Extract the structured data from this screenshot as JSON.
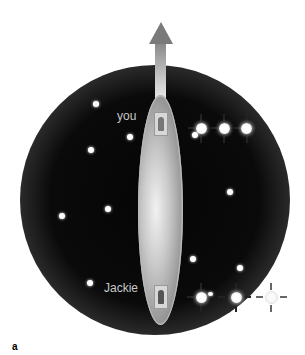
{
  "figure": {
    "panel_label": "a",
    "labels": {
      "top_person": "you",
      "bottom_person": "Jackie"
    },
    "colors": {
      "space": "#050505",
      "sphere_edge": "#ffffff",
      "capsule": "#c9c9c9",
      "arrow": "#7a7a7a",
      "stars": "#ffffff",
      "label_text": "#c8c8c8"
    },
    "icons": {
      "arrow": "up-arrow-icon",
      "person_top": "person-icon",
      "person_bottom": "person-icon"
    },
    "background_stars": [
      {
        "x": 96,
        "y": 104
      },
      {
        "x": 130,
        "y": 137
      },
      {
        "x": 91,
        "y": 150
      },
      {
        "x": 108,
        "y": 209
      },
      {
        "x": 62,
        "y": 216
      },
      {
        "x": 230,
        "y": 192
      },
      {
        "x": 193,
        "y": 259
      },
      {
        "x": 240,
        "y": 268
      },
      {
        "x": 90,
        "y": 283
      }
    ],
    "top_signal_row": {
      "y": 128,
      "stars_x": [
        201,
        224,
        246
      ],
      "small_dot": {
        "x": 195,
        "y": 135
      }
    },
    "bottom_signal_row": {
      "y": 297,
      "stars_x": [
        201,
        236,
        270
      ],
      "small_dot": {
        "x": 211,
        "y": 295
      }
    }
  }
}
